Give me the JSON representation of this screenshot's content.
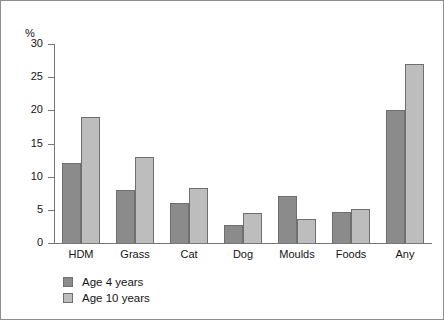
{
  "chart_data": {
    "type": "bar",
    "title": "",
    "xlabel": "",
    "ylabel": "%",
    "ylim": [
      0,
      30
    ],
    "yticks": [
      0,
      5,
      10,
      15,
      20,
      25,
      30
    ],
    "ytick_labels": [
      "0",
      "5",
      "10",
      "15",
      "20",
      "25",
      "30"
    ],
    "grid": false,
    "legend_position": "bottom-left",
    "categories": [
      "HDM",
      "Grass",
      "Cat",
      "Dog",
      "Moulds",
      "Foods",
      "Any"
    ],
    "series": [
      {
        "name": "Age 4 years",
        "color": "#8b8b8b",
        "values": [
          12,
          8,
          6,
          2.7,
          7.1,
          4.7,
          20
        ]
      },
      {
        "name": "Age 10 years",
        "color": "#bdbdbd",
        "values": [
          19,
          13,
          8.3,
          4.5,
          3.6,
          5.1,
          27
        ]
      }
    ]
  },
  "legend": {
    "items": [
      {
        "label": "Age 4 years",
        "color": "#8b8b8b"
      },
      {
        "label": "Age 10 years",
        "color": "#bdbdbd"
      }
    ]
  },
  "axis": {
    "unit_label": "%"
  }
}
